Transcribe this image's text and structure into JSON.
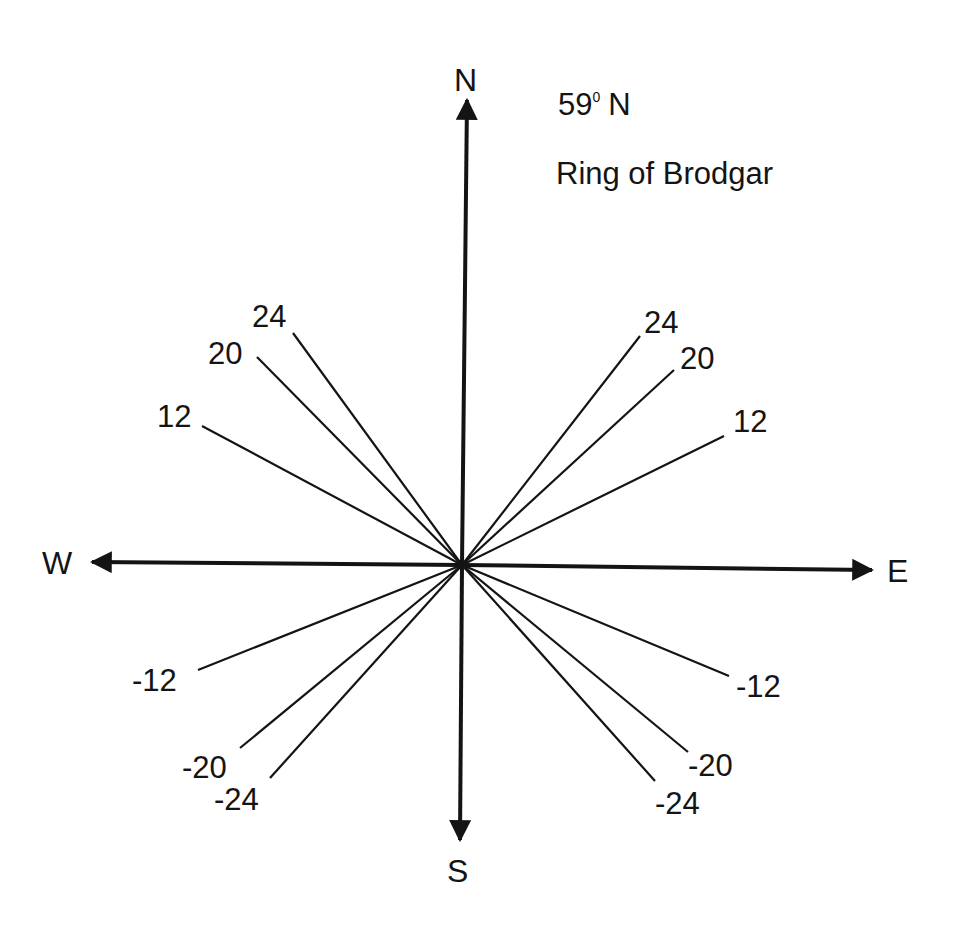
{
  "diagram": {
    "latitude_label": "59° N",
    "latitude_value": "59",
    "latitude_degree_sup": "0",
    "latitude_hemisphere": "N",
    "site_label": "Ring of Brodgar",
    "center": [
      462,
      565
    ],
    "stroke_color": "#141414",
    "background_color": "#ffffff",
    "compass": {
      "north": {
        "label": "N",
        "tip": [
          467,
          95
        ],
        "label_pos": [
          454,
          91
        ]
      },
      "south": {
        "label": "S",
        "tip": [
          460,
          845
        ],
        "label_pos": [
          447,
          882
        ]
      },
      "west": {
        "label": "W",
        "tip": [
          87,
          562
        ],
        "label_pos": [
          42,
          574
        ]
      },
      "east": {
        "label": "E",
        "tip": [
          877,
          570
        ],
        "label_pos": [
          887,
          582
        ]
      }
    },
    "declination_lines": [
      {
        "label": "24",
        "quadrant": "NW",
        "end": [
          293,
          333
        ],
        "label_pos": [
          252,
          327
        ]
      },
      {
        "label": "20",
        "quadrant": "NW",
        "end": [
          257,
          357
        ],
        "label_pos": [
          208,
          364
        ]
      },
      {
        "label": "12",
        "quadrant": "NW",
        "end": [
          202,
          426
        ],
        "label_pos": [
          157,
          427
        ]
      },
      {
        "label": "24",
        "quadrant": "NE",
        "end": [
          640,
          336
        ],
        "label_pos": [
          644,
          333
        ]
      },
      {
        "label": "20",
        "quadrant": "NE",
        "end": [
          674,
          370
        ],
        "label_pos": [
          680,
          369
        ]
      },
      {
        "label": "12",
        "quadrant": "NE",
        "end": [
          724,
          436
        ],
        "label_pos": [
          733,
          432
        ]
      },
      {
        "label": "-12",
        "quadrant": "SW",
        "end": [
          198,
          670
        ],
        "label_pos": [
          132,
          691
        ]
      },
      {
        "label": "-20",
        "quadrant": "SW",
        "end": [
          240,
          748
        ],
        "label_pos": [
          182,
          778
        ]
      },
      {
        "label": "-24",
        "quadrant": "SE-left",
        "end": [
          270,
          778
        ],
        "label_pos": [
          214,
          810
        ]
      },
      {
        "label": "-12",
        "quadrant": "SE",
        "end": [
          729,
          676
        ],
        "label_pos": [
          736,
          697
        ]
      },
      {
        "label": "-20",
        "quadrant": "SE",
        "end": [
          688,
          752
        ],
        "label_pos": [
          688,
          776
        ]
      },
      {
        "label": "-24",
        "quadrant": "SE",
        "end": [
          655,
          781
        ],
        "label_pos": [
          655,
          814
        ]
      }
    ]
  }
}
